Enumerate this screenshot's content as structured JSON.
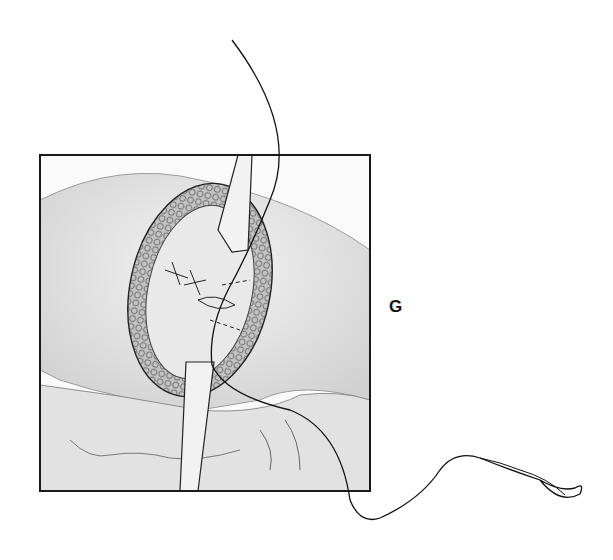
{
  "figure": {
    "panel_label": "G",
    "colors": {
      "background": "#ffffff",
      "frame": "#1a1a1a",
      "ink": "#222222",
      "skin_shade": "#d8d8d8",
      "wound_shade": "#9a9a9a"
    }
  }
}
